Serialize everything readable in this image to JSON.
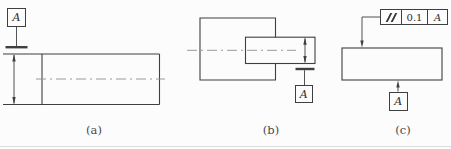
{
  "drawing": {
    "figures": {
      "a": {
        "caption": "(a)",
        "datum": {
          "label": "A"
        }
      },
      "b": {
        "caption": "(b)",
        "datum": {
          "label": "A"
        }
      },
      "c": {
        "caption": "(c)",
        "datum": {
          "label": "A"
        },
        "feature_control_frame": {
          "symbol_name": "parallelism",
          "symbol_glyph": "//",
          "tolerance": "0.1",
          "datum_reference": "A"
        }
      }
    },
    "colors": {
      "line": "#3f3f3f",
      "centerline": "#8f8f8f",
      "background": "#fcfcfc",
      "bottom_rule": "#dcdcdc"
    }
  }
}
